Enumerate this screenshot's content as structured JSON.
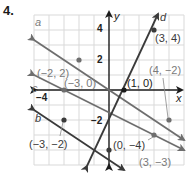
{
  "problem_number": "4.",
  "axes": {
    "x_label": "x",
    "y_label": "y",
    "ticks": {
      "x_neg4": "−4",
      "y_4": "4",
      "y_2": "2",
      "y_neg2": "−2"
    }
  },
  "colors": {
    "grid": "#d9d9d9",
    "axis": "#1a1a1a",
    "line_dark": "#3a3a3a",
    "line_gray": "#6e6e6e",
    "label_gray": "#7a7a7a"
  },
  "lines": [
    {
      "name": "a",
      "points": [
        [
          -2,
          2
        ],
        [
          4,
          -2
        ]
      ],
      "slope": "-2/3"
    },
    {
      "name": "b",
      "points": [
        [
          -3,
          -2
        ],
        [
          0,
          -4
        ]
      ],
      "slope": "-2/3"
    },
    {
      "name": "c",
      "points": [
        [
          -3,
          0
        ],
        [
          3,
          -3
        ]
      ],
      "slope": "-1/2"
    },
    {
      "name": "d",
      "points": [
        [
          1,
          0
        ],
        [
          3,
          4
        ]
      ],
      "slope": "2"
    }
  ],
  "point_labels": {
    "p1": "(−2, 2)",
    "p2": "(−3, 0)",
    "p3": "(1, 0)",
    "p4": "(3, 4)",
    "p5": "(4, −2)",
    "p6": "(−3, −2)",
    "p7": "(0, −4)",
    "p8": "(3, −3)"
  },
  "line_labels": {
    "a": "a",
    "b": "b",
    "c": "c",
    "d": "d"
  }
}
